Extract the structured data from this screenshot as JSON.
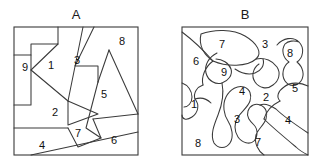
{
  "figure": {
    "title": "",
    "background_color": "#ffffff",
    "line_color": "#3a3a3a",
    "label_color": "#111111"
  },
  "panels": [
    {
      "id": "A",
      "label": "A",
      "label_pos": {
        "x": 76,
        "y": 16
      },
      "partition_style": "straight-line polygonal",
      "frame": {
        "x": 14,
        "y": 27,
        "width": 124,
        "height": 128
      },
      "regions": [
        {
          "id": "a-9",
          "label": "9",
          "x": 25,
          "y": 68
        },
        {
          "id": "a-1",
          "label": "1",
          "x": 51,
          "y": 66
        },
        {
          "id": "a-3",
          "label": "3",
          "x": 76,
          "y": 61
        },
        {
          "id": "a-8",
          "label": "8",
          "x": 122,
          "y": 42
        },
        {
          "id": "a-5",
          "label": "5",
          "x": 103,
          "y": 95
        },
        {
          "id": "a-2",
          "label": "2",
          "x": 55,
          "y": 113
        },
        {
          "id": "a-7",
          "label": "7",
          "x": 77,
          "y": 133
        },
        {
          "id": "a-4",
          "label": "4",
          "x": 42,
          "y": 146
        },
        {
          "id": "a-6",
          "label": "6",
          "x": 113,
          "y": 141
        }
      ],
      "dividers": [
        "M14,55 L31,55 L31,44 L58,44 L58,27",
        "M14,105 L31,105 L31,55",
        "M58,44 L31,70",
        "M31,70 L68,101",
        "M68,101 L57,93 L68,101",
        "M68,101 L83,27",
        "M68,101 L98,114 L68,125 L68,101",
        "M14,128 L68,128",
        "M68,128 L78,146 L100,138 L93,119",
        "M31,155 L138,132",
        "M83,27 L68,101",
        "M94,27 L75,65 L98,65 L98,82",
        "M98,82 L138,114",
        "M109,50 L98,82",
        "M109,50 L138,114",
        "M98,82 L85,128",
        "M85,128 L100,138"
      ]
    },
    {
      "id": "B",
      "label": "B",
      "label_pos": {
        "x": 245,
        "y": 16
      },
      "partition_style": "curved organic blobs",
      "frame": {
        "x": 182,
        "y": 27,
        "width": 126,
        "height": 128
      },
      "regions": [
        {
          "id": "b-7",
          "label": "7",
          "x": 222,
          "y": 45
        },
        {
          "id": "b-3a",
          "label": "3",
          "x": 265,
          "y": 45
        },
        {
          "id": "b-8a",
          "label": "8",
          "x": 289,
          "y": 54
        },
        {
          "id": "b-6",
          "label": "6",
          "x": 196,
          "y": 62
        },
        {
          "id": "b-9",
          "label": "9",
          "x": 224,
          "y": 73
        },
        {
          "id": "b-5",
          "label": "5",
          "x": 294,
          "y": 89
        },
        {
          "id": "b-4a",
          "label": "4",
          "x": 242,
          "y": 92
        },
        {
          "id": "b-2",
          "label": "2",
          "x": 266,
          "y": 97
        },
        {
          "id": "b-1",
          "label": "1",
          "x": 194,
          "y": 105
        },
        {
          "id": "b-3b",
          "label": "3",
          "x": 237,
          "y": 119
        },
        {
          "id": "b-4b",
          "label": "4",
          "x": 288,
          "y": 120
        },
        {
          "id": "b-8b",
          "label": "8",
          "x": 198,
          "y": 144
        },
        {
          "id": "b-7b",
          "label": "7",
          "x": 258,
          "y": 143
        }
      ],
      "dividers": [
        "M182,32 C196,40 206,52 214,60",
        "M200,34 C214,30 232,30 244,36 C256,42 262,52 256,58 C248,66 228,66 214,60 C206,55 198,46 200,34",
        "M214,60 C206,66 202,76 204,84",
        "M256,58 C264,56 272,60 276,66",
        "M276,66 C280,72 278,80 272,84",
        "M272,84 C266,90 258,88 254,82",
        "M254,82 C250,76 252,68 258,64",
        "M276,44 C282,38 292,36 298,42 C304,48 302,58 296,62 C302,66 304,74 300,80 C296,86 288,86 284,80",
        "M284,80 C280,74 282,66 288,62",
        "M288,62 C282,58 280,50 284,44",
        "M284,44 C288,40 294,40 298,42",
        "M308,86 C300,82 290,82 284,86",
        "M284,86 C278,90 276,96 280,100",
        "M216,52 C208,56 204,64 206,72",
        "M206,72 C208,80 216,84 222,82",
        "M222,82 C228,80 232,74 230,68",
        "M230,68 C228,62 222,58 216,58",
        "M204,84 C198,86 194,92 196,98",
        "M182,82 C188,84 192,90 192,96",
        "M192,96 C192,102 188,106 184,106",
        "M196,98 C200,104 198,112 192,116",
        "M192,116 C186,120 182,118 182,114",
        "M222,82 C224,92 222,104 218,114",
        "M218,114 C214,124 210,134 214,142",
        "M214,142 C218,148 226,148 230,142",
        "M230,142 C234,136 232,126 228,120",
        "M228,120 C224,114 222,104 226,96",
        "M226,96 C230,88 238,84 244,86",
        "M244,86 C250,88 252,94 250,100",
        "M250,100 C248,106 242,110 238,116",
        "M238,116 C234,122 234,130 238,136",
        "M238,136 C242,142 250,144 254,140",
        "M254,140 C258,136 258,128 254,124",
        "M254,124 C250,120 246,116 248,110",
        "M248,110 C250,104 256,102 260,104",
        "M260,104 C266,106 268,112 266,118",
        "M266,118 C264,124 258,128 256,134",
        "M256,134 C254,142 258,150 264,154",
        "M280,100 C272,104 266,110 264,118",
        "M308,132 C296,124 284,116 276,108",
        "M276,108 C270,104 264,102 260,104",
        "M264,118 C272,126 284,136 296,146",
        "M296,146 C300,150 304,153 308,155",
        "M234,68 C240,72 248,74 254,72",
        "M254,72 C260,70 264,64 262,58",
        "M196,98 C202,96 208,98 212,102"
      ]
    }
  ]
}
